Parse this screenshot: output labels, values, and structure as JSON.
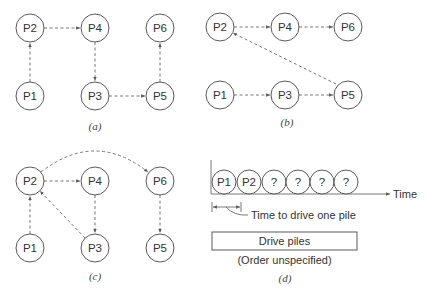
{
  "panels": {
    "a": {
      "caption": "(a)",
      "nodes": [
        {
          "id": "P1",
          "label": "P1"
        },
        {
          "id": "P2",
          "label": "P2"
        },
        {
          "id": "P3",
          "label": "P3"
        },
        {
          "id": "P4",
          "label": "P4"
        },
        {
          "id": "P5",
          "label": "P5"
        },
        {
          "id": "P6",
          "label": "P6"
        }
      ],
      "edges": [
        {
          "from": "P1",
          "to": "P2"
        },
        {
          "from": "P2",
          "to": "P4"
        },
        {
          "from": "P4",
          "to": "P3"
        },
        {
          "from": "P3",
          "to": "P5"
        },
        {
          "from": "P5",
          "to": "P6"
        }
      ]
    },
    "b": {
      "caption": "(b)",
      "nodes": [
        {
          "id": "P1",
          "label": "P1"
        },
        {
          "id": "P2",
          "label": "P2"
        },
        {
          "id": "P3",
          "label": "P3"
        },
        {
          "id": "P4",
          "label": "P4"
        },
        {
          "id": "P5",
          "label": "P5"
        },
        {
          "id": "P6",
          "label": "P6"
        }
      ],
      "edges": [
        {
          "from": "P1",
          "to": "P3"
        },
        {
          "from": "P3",
          "to": "P5"
        },
        {
          "from": "P5",
          "to": "P2"
        },
        {
          "from": "P2",
          "to": "P4"
        },
        {
          "from": "P4",
          "to": "P6"
        }
      ]
    },
    "c": {
      "caption": "(c)",
      "nodes": [
        {
          "id": "P1",
          "label": "P1"
        },
        {
          "id": "P2",
          "label": "P2"
        },
        {
          "id": "P3",
          "label": "P3"
        },
        {
          "id": "P4",
          "label": "P4"
        },
        {
          "id": "P5",
          "label": "P5"
        },
        {
          "id": "P6",
          "label": "P6"
        }
      ],
      "edges": [
        {
          "from": "P1",
          "to": "P2"
        },
        {
          "from": "P2",
          "to": "P4"
        },
        {
          "from": "P4",
          "to": "P3"
        },
        {
          "from": "P3",
          "to": "P2"
        },
        {
          "from": "P2",
          "to": "P6"
        },
        {
          "from": "P6",
          "to": "P5"
        }
      ]
    },
    "d": {
      "caption": "(d)",
      "timeline_piles": [
        "P1",
        "P2",
        "?",
        "?",
        "?",
        "?"
      ],
      "axis_label": "Time",
      "duration_annotation": "Time to drive one pile",
      "activity_box_label": "Drive piles",
      "activity_note": "(Order unspecified)"
    }
  }
}
